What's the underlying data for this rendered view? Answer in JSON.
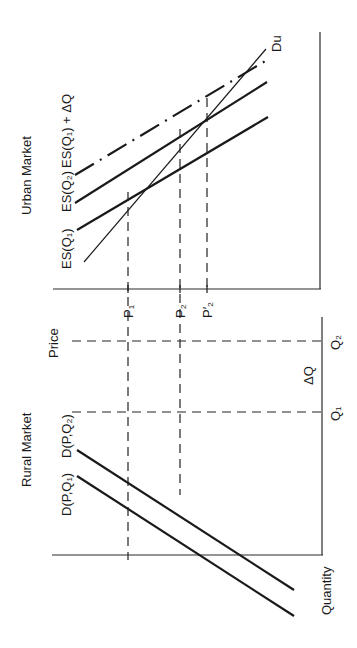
{
  "diagram": {
    "orientation": "rotated 90° counter-clockwise (text reads bottom-to-top)",
    "panels": {
      "urban": {
        "title": "Urban Market",
        "demand_curve": "Du",
        "supply_curves": [
          {
            "label": "ES(Q₁)",
            "style": "solid"
          },
          {
            "label": "ES(Q₂)",
            "style": "solid"
          },
          {
            "label": "ES(Q₁) + ΔQ",
            "style": "dash-dot"
          }
        ],
        "price_markers": [
          "P₁",
          "P₂",
          "P′₂"
        ]
      },
      "rural": {
        "title": "Rural Market",
        "demand_curves": [
          {
            "label": "D(P,Q₁)",
            "style": "solid"
          },
          {
            "label": "D(P,Q₂)",
            "style": "solid"
          }
        ]
      }
    },
    "axes": {
      "price_label": "Price",
      "quantity_label": "Quantity",
      "quantity_markers": [
        "Q₁",
        "Q₂"
      ],
      "delta_label": "ΔQ"
    },
    "labels": {
      "urban_title": "Urban Market",
      "rural_title": "Rural Market",
      "price": "Price",
      "quantity": "Quantity",
      "du": "Du",
      "es_q1": "ES(Q₁)",
      "es_q2": "ES(Q₂)",
      "es_q1_dq": "ES(Q₁) + ΔQ",
      "d_pq1": "D(P,Q₁)",
      "d_pq2": "D(P,Q₂)",
      "p1": "P₁",
      "p2": "P₂",
      "p2_prime": "P′₂",
      "q1": "Q₁",
      "q2": "Q₂",
      "delta_q": "ΔQ"
    }
  }
}
